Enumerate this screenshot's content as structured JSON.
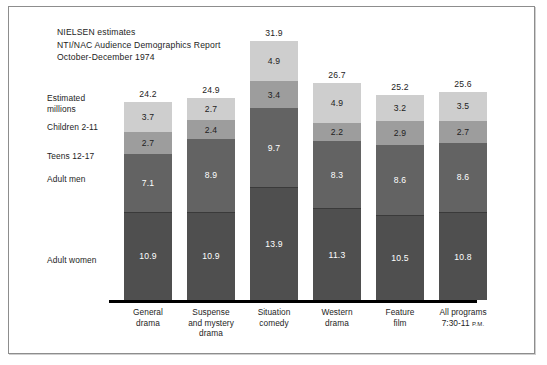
{
  "header": {
    "line1": "NIELSEN estimates",
    "line2": "NTI/NAC Audience Demographics Report",
    "line3": "October-December 1974"
  },
  "row_labels": {
    "estimated_1": "Estimated",
    "estimated_2": "millions",
    "children": "Children 2-11",
    "teens": "Teens 12-17",
    "men": "Adult men",
    "women": "Adult women"
  },
  "axis_note": {
    "all_programs_time": "7:30-11",
    "ampm": "P.M."
  },
  "chart_data": {
    "type": "bar",
    "subtype": "stacked",
    "ylabel": "Estimated millions",
    "xlabel": "",
    "grid": false,
    "legend": "row-labels-left",
    "categories": [
      "General drama",
      "Suspense and mystery drama",
      "Situation comedy",
      "Western drama",
      "Feature film",
      "All programs 7:30-11 P.M."
    ],
    "category_lines": [
      [
        "General",
        "drama"
      ],
      [
        "Suspense",
        "and mystery",
        "drama"
      ],
      [
        "Situation",
        "comedy"
      ],
      [
        "Western",
        "drama"
      ],
      [
        "Feature",
        "film"
      ],
      [
        "All programs",
        "7:30-11 P.M."
      ]
    ],
    "series": [
      {
        "name": "Children 2-11",
        "color": "#cecece",
        "values": [
          3.7,
          2.7,
          4.9,
          4.9,
          3.2,
          3.5
        ]
      },
      {
        "name": "Teens 12-17",
        "color": "#9d9d9d",
        "values": [
          2.7,
          2.4,
          3.4,
          2.2,
          2.9,
          2.7
        ]
      },
      {
        "name": "Adult men",
        "color": "#636363",
        "values": [
          7.1,
          8.9,
          9.7,
          8.3,
          8.6,
          8.6
        ]
      },
      {
        "name": "Adult women",
        "color": "#4f4f4f",
        "values": [
          10.9,
          10.9,
          13.9,
          11.3,
          10.5,
          10.8
        ]
      }
    ],
    "totals": [
      24.2,
      24.9,
      31.9,
      26.7,
      25.2,
      25.6
    ],
    "ylim": [
      0,
      31.9
    ],
    "units": "millions"
  }
}
